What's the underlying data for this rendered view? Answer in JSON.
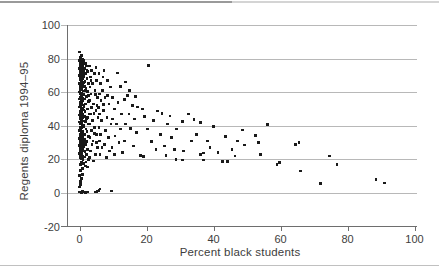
{
  "chart_data": {
    "type": "scatter",
    "title": "",
    "xlabel": "Percent black students",
    "ylabel": "Regents diploma 1994–95",
    "xlim": [
      -4,
      101
    ],
    "ylim": [
      -20,
      100
    ],
    "xticks": [
      0,
      20,
      40,
      60,
      80,
      100
    ],
    "ytick_labels": [
      100,
      80,
      60,
      40,
      20,
      0,
      -20
    ],
    "grid_y_values": [
      100,
      80,
      60,
      40,
      20,
      0
    ],
    "grid_on": true,
    "legend": "none",
    "style": {
      "grid_color": "#b8b8b8",
      "axis_color": "#6e6e6e",
      "marker_color": "#1a1a1a",
      "text_color": "#3d3d3d",
      "top_rule_left_color": "#9a9a9a",
      "top_rule_right_color": "#d4d4d4",
      "bottom_rule_color": "#c0c0c0",
      "marker_shape": "square"
    },
    "points": [
      [
        0,
        0.5
      ],
      [
        0.3,
        0.6
      ],
      [
        0.6,
        0.4
      ],
      [
        0.9,
        0.7
      ],
      [
        1.2,
        0.5
      ],
      [
        1.5,
        0.6
      ],
      [
        1.8,
        0.4
      ],
      [
        2.1,
        0.6
      ],
      [
        2.4,
        0.5
      ],
      [
        4.6,
        0.6
      ],
      [
        5.2,
        0.8
      ],
      [
        5.8,
        1.5
      ],
      [
        6.1,
        2.4
      ],
      [
        9.5,
        1.2
      ],
      [
        0.1,
        3.5
      ],
      [
        0.4,
        5
      ],
      [
        0.2,
        7
      ],
      [
        0.6,
        8.5
      ],
      [
        0.1,
        10.5
      ],
      [
        0.9,
        11
      ],
      [
        0.3,
        13.5
      ],
      [
        0.8,
        14.5
      ],
      [
        1.8,
        16
      ],
      [
        0.2,
        17
      ],
      [
        1.1,
        17.5
      ],
      [
        2.3,
        15.5
      ],
      [
        0.5,
        18.5
      ],
      [
        0.1,
        84
      ],
      [
        0.5,
        82
      ],
      [
        0.2,
        80.5
      ],
      [
        0.8,
        79.5
      ],
      [
        0.1,
        79
      ],
      [
        0.4,
        78.2
      ],
      [
        0.9,
        77.5
      ],
      [
        0.2,
        77
      ],
      [
        0.6,
        76.4
      ],
      [
        1.0,
        75.8
      ],
      [
        0.3,
        75.2
      ],
      [
        0.7,
        74.6
      ],
      [
        0.1,
        74
      ],
      [
        0.5,
        73.4
      ],
      [
        1.1,
        72.8
      ],
      [
        0.2,
        72.2
      ],
      [
        0.8,
        71.6
      ],
      [
        0.4,
        71
      ],
      [
        0.9,
        70.4
      ],
      [
        0.1,
        69.8
      ],
      [
        0.6,
        69.2
      ],
      [
        0.3,
        68.6
      ],
      [
        1.0,
        68
      ],
      [
        0.2,
        67.4
      ],
      [
        0.7,
        66.8
      ],
      [
        0.5,
        66.2
      ],
      [
        1.1,
        65.6
      ],
      [
        0.1,
        65
      ],
      [
        0.8,
        64.4
      ],
      [
        0.3,
        63.8
      ],
      [
        0.9,
        63.2
      ],
      [
        0.2,
        62.6
      ],
      [
        0.6,
        62
      ],
      [
        0.4,
        61.4
      ],
      [
        1.0,
        60.8
      ],
      [
        0.1,
        60.2
      ],
      [
        0.7,
        59.6
      ],
      [
        0.3,
        59
      ],
      [
        1.1,
        58.4
      ],
      [
        0.5,
        57.8
      ],
      [
        0.2,
        57.2
      ],
      [
        0.8,
        56.6
      ],
      [
        0.1,
        56
      ],
      [
        0.6,
        55.4
      ],
      [
        0.9,
        54.8
      ],
      [
        0.3,
        54.2
      ],
      [
        0.7,
        53.6
      ],
      [
        0.2,
        53
      ],
      [
        1.0,
        52.4
      ],
      [
        0.4,
        51.8
      ],
      [
        0.1,
        51.2
      ],
      [
        0.8,
        50.6
      ],
      [
        0.5,
        50
      ],
      [
        1.1,
        49.4
      ],
      [
        0.2,
        48.8
      ],
      [
        0.6,
        48.2
      ],
      [
        0.3,
        47.6
      ],
      [
        0.9,
        47
      ],
      [
        0.1,
        46.4
      ],
      [
        0.7,
        45.8
      ],
      [
        0.4,
        45.2
      ],
      [
        1.0,
        44.6
      ],
      [
        0.2,
        44
      ],
      [
        0.5,
        43.4
      ],
      [
        0.8,
        42.8
      ],
      [
        0.1,
        42.2
      ],
      [
        0.6,
        41.6
      ],
      [
        0.3,
        41
      ],
      [
        1.1,
        40.4
      ],
      [
        0.9,
        39.8
      ],
      [
        0.2,
        39.2
      ],
      [
        0.7,
        38.6
      ],
      [
        0.4,
        38
      ],
      [
        0.1,
        37.4
      ],
      [
        0.8,
        36.8
      ],
      [
        0.5,
        36.2
      ],
      [
        1.0,
        35.6
      ],
      [
        0.3,
        35
      ],
      [
        0.6,
        34.4
      ],
      [
        0.2,
        33.8
      ],
      [
        0.9,
        33.2
      ],
      [
        0.1,
        32.6
      ],
      [
        0.7,
        32
      ],
      [
        0.4,
        31.4
      ],
      [
        1.1,
        30.8
      ],
      [
        0.2,
        30.2
      ],
      [
        0.8,
        29.6
      ],
      [
        0.5,
        29
      ],
      [
        0.1,
        28.4
      ],
      [
        0.6,
        27.8
      ],
      [
        0.3,
        27.2
      ],
      [
        1.0,
        26.6
      ],
      [
        0.2,
        26
      ],
      [
        0.9,
        25.4
      ],
      [
        0.4,
        24.8
      ],
      [
        0.7,
        24.2
      ],
      [
        0.1,
        23.6
      ],
      [
        0.5,
        23
      ],
      [
        0.3,
        22.4
      ],
      [
        0.8,
        21.8
      ],
      [
        0.2,
        21.2
      ],
      [
        0.6,
        20.6
      ],
      [
        1.0,
        20
      ],
      [
        1.3,
        79
      ],
      [
        1.7,
        77
      ],
      [
        2.1,
        75.5
      ],
      [
        1.4,
        74
      ],
      [
        2.5,
        72.5
      ],
      [
        1.8,
        71
      ],
      [
        1.3,
        69.5
      ],
      [
        2.2,
        68
      ],
      [
        1.6,
        66.5
      ],
      [
        2.7,
        65
      ],
      [
        1.4,
        63.5
      ],
      [
        1.9,
        62
      ],
      [
        2.4,
        60.5
      ],
      [
        1.3,
        59
      ],
      [
        2.0,
        57.5
      ],
      [
        1.5,
        56
      ],
      [
        2.6,
        54.5
      ],
      [
        1.8,
        53
      ],
      [
        1.3,
        51.5
      ],
      [
        2.3,
        50
      ],
      [
        1.6,
        48.5
      ],
      [
        2.8,
        47
      ],
      [
        1.4,
        45.5
      ],
      [
        2.0,
        44
      ],
      [
        1.7,
        42.5
      ],
      [
        2.5,
        41
      ],
      [
        1.3,
        39.5
      ],
      [
        1.9,
        38
      ],
      [
        2.2,
        36.5
      ],
      [
        1.5,
        35
      ],
      [
        2.7,
        33.5
      ],
      [
        1.4,
        32
      ],
      [
        2.1,
        30.5
      ],
      [
        1.8,
        29
      ],
      [
        1.3,
        27.5
      ],
      [
        2.4,
        26
      ],
      [
        1.6,
        24.5
      ],
      [
        2.0,
        23
      ],
      [
        1.5,
        21.5
      ],
      [
        2.6,
        20
      ],
      [
        1.9,
        18.5
      ],
      [
        2.3,
        44.8
      ],
      [
        2.6,
        58
      ],
      [
        1.7,
        60.9
      ],
      [
        2.2,
        73
      ],
      [
        3.0,
        75.5
      ],
      [
        3.6,
        73
      ],
      [
        4.4,
        71
      ],
      [
        3.2,
        69
      ],
      [
        5.0,
        67
      ],
      [
        3.8,
        65
      ],
      [
        3.1,
        63
      ],
      [
        4.6,
        61
      ],
      [
        3.4,
        59
      ],
      [
        5.3,
        57
      ],
      [
        3.0,
        55
      ],
      [
        4.1,
        53
      ],
      [
        3.6,
        51
      ],
      [
        4.9,
        49
      ],
      [
        3.2,
        47
      ],
      [
        5.5,
        45
      ],
      [
        3.9,
        43
      ],
      [
        3.0,
        41
      ],
      [
        4.4,
        39
      ],
      [
        3.5,
        37
      ],
      [
        5.1,
        35
      ],
      [
        3.1,
        33
      ],
      [
        4.0,
        31
      ],
      [
        3.7,
        29
      ],
      [
        5.4,
        27
      ],
      [
        3.3,
        25
      ],
      [
        4.7,
        23
      ],
      [
        3.0,
        21
      ],
      [
        4.2,
        19
      ],
      [
        5.2,
        52
      ],
      [
        4.8,
        58.5
      ],
      [
        3.4,
        66.8
      ],
      [
        4.3,
        47.5
      ],
      [
        5.0,
        30
      ],
      [
        4.5,
        35.5
      ],
      [
        5.8,
        71
      ],
      [
        7.0,
        69
      ],
      [
        8.4,
        67
      ],
      [
        6.2,
        65
      ],
      [
        9.2,
        63
      ],
      [
        6.8,
        61
      ],
      [
        5.9,
        59
      ],
      [
        7.6,
        57
      ],
      [
        6.4,
        55
      ],
      [
        8.8,
        53
      ],
      [
        5.7,
        51
      ],
      [
        7.2,
        49
      ],
      [
        6.0,
        47
      ],
      [
        8.2,
        45
      ],
      [
        6.6,
        43
      ],
      [
        9.4,
        41
      ],
      [
        5.8,
        39
      ],
      [
        7.8,
        37
      ],
      [
        6.3,
        35
      ],
      [
        8.6,
        33
      ],
      [
        5.9,
        31
      ],
      [
        7.4,
        29
      ],
      [
        6.7,
        27
      ],
      [
        9.0,
        25
      ],
      [
        6.1,
        23
      ],
      [
        8.0,
        21
      ],
      [
        7.1,
        52.5
      ],
      [
        8.3,
        58
      ],
      [
        7.3,
        73
      ],
      [
        4.9,
        74.5
      ],
      [
        9.8,
        57
      ],
      [
        11.5,
        54
      ],
      [
        10.4,
        50
      ],
      [
        12.6,
        47
      ],
      [
        9.9,
        44
      ],
      [
        11.0,
        41
      ],
      [
        12.2,
        38
      ],
      [
        10.6,
        34
      ],
      [
        11.8,
        30
      ],
      [
        9.7,
        27
      ],
      [
        12.9,
        24
      ],
      [
        10.5,
        23.1
      ],
      [
        11.3,
        71.5
      ],
      [
        13.7,
        66
      ],
      [
        12.2,
        63.5
      ],
      [
        20.6,
        76
      ],
      [
        14.3,
        58
      ],
      [
        15.8,
        52
      ],
      [
        17.3,
        51.2
      ],
      [
        18.8,
        50
      ],
      [
        23.3,
        48.8
      ],
      [
        13.4,
        55.5
      ],
      [
        14.8,
        47
      ],
      [
        16.4,
        44
      ],
      [
        13.8,
        41
      ],
      [
        15.2,
        38.5
      ],
      [
        17.0,
        36
      ],
      [
        19.5,
        45.5
      ],
      [
        20.2,
        38
      ],
      [
        21.4,
        30.5
      ],
      [
        22.0,
        43
      ],
      [
        24.1,
        35
      ],
      [
        25.3,
        28
      ],
      [
        26.2,
        41
      ],
      [
        27.5,
        33
      ],
      [
        28.3,
        26
      ],
      [
        29.0,
        38
      ],
      [
        18.3,
        22.3
      ],
      [
        19.2,
        21.9
      ],
      [
        16.1,
        28
      ],
      [
        13.5,
        31
      ],
      [
        25.8,
        22.5
      ],
      [
        28.8,
        20
      ],
      [
        24.6,
        47.3
      ],
      [
        22.8,
        25.8
      ],
      [
        27.0,
        45.9
      ],
      [
        15.0,
        61
      ],
      [
        16.8,
        57.5
      ],
      [
        32.5,
        47
      ],
      [
        30.7,
        42.5
      ],
      [
        36.1,
        42
      ],
      [
        40,
        39.4
      ],
      [
        31,
        25
      ],
      [
        33.4,
        31
      ],
      [
        35.0,
        35
      ],
      [
        38.2,
        31
      ],
      [
        39.0,
        27
      ],
      [
        41.3,
        24
      ],
      [
        42.6,
        18.7
      ],
      [
        44.2,
        18.8
      ],
      [
        45.5,
        26
      ],
      [
        47.2,
        31
      ],
      [
        48.6,
        37.5
      ],
      [
        37,
        23.8
      ],
      [
        30.7,
        19.7
      ],
      [
        36.1,
        23.1
      ],
      [
        37.1,
        19.7
      ],
      [
        43.5,
        33.7
      ],
      [
        46.4,
        22
      ],
      [
        34.2,
        43.6
      ],
      [
        49.3,
        28.5
      ],
      [
        52.5,
        34.4
      ],
      [
        53.4,
        30
      ],
      [
        56.1,
        40.6
      ],
      [
        54,
        23
      ],
      [
        59,
        17
      ],
      [
        59.8,
        18.3
      ],
      [
        64.4,
        29
      ],
      [
        65.5,
        30
      ],
      [
        66,
        13
      ],
      [
        72,
        5.5
      ],
      [
        74.7,
        22
      ],
      [
        76.9,
        17
      ],
      [
        88.5,
        8
      ],
      [
        91,
        6
      ]
    ]
  }
}
